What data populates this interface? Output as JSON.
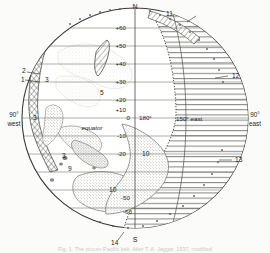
{
  "figure": {
    "title_caption": "Fig. 1. The circum-Pacific belt.  After T. A. Jaggar, 1937, modified",
    "cardinals": {
      "north": "N",
      "south": "S",
      "west_edge_line1": "90°",
      "west_edge_line2": "west",
      "east_edge_line1": "90°",
      "east_edge_line2": "east"
    },
    "equator_label": "equator",
    "central_meridian_label": "180°",
    "meridian_150e_label": "150° east",
    "latitude_labels": [
      {
        "id": "lat-p60",
        "text": "+60",
        "value": 60
      },
      {
        "id": "lat-p50",
        "text": "+50",
        "value": 50
      },
      {
        "id": "lat-p40",
        "text": "+40",
        "value": 40
      },
      {
        "id": "lat-p30",
        "text": "+30",
        "value": 30
      },
      {
        "id": "lat-p20",
        "text": "+20",
        "value": 20
      },
      {
        "id": "lat-p10",
        "text": "+10",
        "value": 10
      },
      {
        "id": "lat-0",
        "text": "0",
        "value": 0
      },
      {
        "id": "lat-m10",
        "text": "-10",
        "value": -10
      },
      {
        "id": "lat-m20",
        "text": "-20",
        "value": -20
      },
      {
        "id": "lat-m50",
        "text": "-50",
        "value": -50
      },
      {
        "id": "lat-m60",
        "text": "-60",
        "value": -60
      }
    ],
    "annotation_numbers": [
      {
        "id": "n1",
        "text": "1"
      },
      {
        "id": "n2",
        "text": "2"
      },
      {
        "id": "n3a",
        "text": "3"
      },
      {
        "id": "n3b",
        "text": "3"
      },
      {
        "id": "n3c",
        "text": "3"
      },
      {
        "id": "n5",
        "text": "5"
      },
      {
        "id": "n9",
        "text": "9"
      },
      {
        "id": "n10a",
        "text": "10"
      },
      {
        "id": "n10b",
        "text": "10"
      },
      {
        "id": "n11",
        "text": "11"
      },
      {
        "id": "n12",
        "text": "12"
      },
      {
        "id": "n13",
        "text": "13"
      },
      {
        "id": "n14",
        "text": "14"
      }
    ],
    "colors": {
      "ink": "#23231f",
      "globe_outline": "#3a3a34",
      "graticule": "#6a6a60",
      "hatch": "#4a4a42",
      "stipple": "#8c8c82",
      "paper": "#fbfbf9"
    }
  }
}
